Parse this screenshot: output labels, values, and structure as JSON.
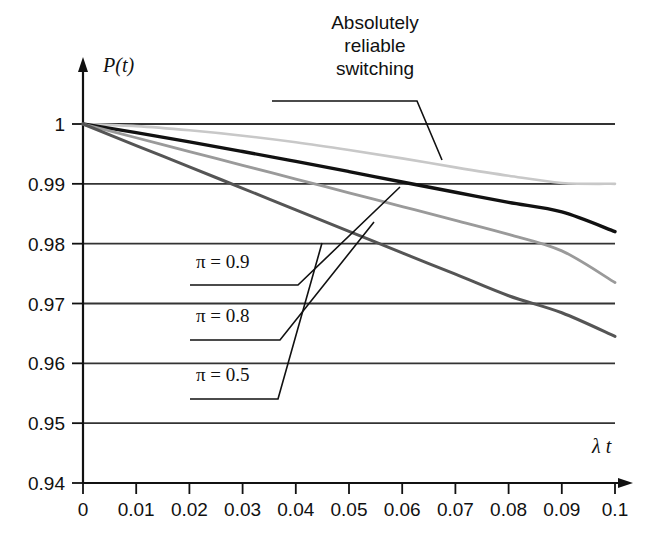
{
  "chart_data": {
    "type": "line",
    "title": "",
    "xlabel": "λ t",
    "ylabel": "P(t)",
    "xlim": [
      0,
      0.1
    ],
    "ylim": [
      0.94,
      1.0
    ],
    "grid": true,
    "legend_position": "inline-callouts",
    "xticks": [
      "0",
      "0.01",
      "0.02",
      "0.03",
      "0.04",
      "0.05",
      "0.06",
      "0.07",
      "0.08",
      "0.09",
      "0.1"
    ],
    "xtick_values": [
      0,
      0.01,
      0.02,
      0.03,
      0.04,
      0.05,
      0.06,
      0.07,
      0.08,
      0.09,
      0.1
    ],
    "yticks": [
      "0.94",
      "0.95",
      "0.96",
      "0.97",
      "0.98",
      "0.99",
      "1"
    ],
    "ytick_values": [
      0.94,
      0.95,
      0.96,
      0.97,
      0.98,
      0.99,
      1.0
    ],
    "x": [
      0,
      0.01,
      0.02,
      0.03,
      0.04,
      0.05,
      0.06,
      0.07,
      0.08,
      0.09,
      0.1
    ],
    "series": [
      {
        "name": "Absolutely reliable switching",
        "color": "#c8c8c8",
        "width": 2.6,
        "values": [
          1.0,
          0.99965,
          0.99895,
          0.99805,
          0.99695,
          0.99565,
          0.99425,
          0.99275,
          0.99135,
          0.99015,
          0.99
        ]
      },
      {
        "name": "π = 0.9",
        "color": "#111111",
        "width": 3.4,
        "values": [
          1.0,
          0.99855,
          0.997,
          0.9954,
          0.99375,
          0.99205,
          0.9903,
          0.9886,
          0.9869,
          0.9853,
          0.982
        ]
      },
      {
        "name": "π = 0.8",
        "color": "#9a9a9a",
        "width": 2.8,
        "values": [
          1.0,
          0.9977,
          0.9954,
          0.9931,
          0.9908,
          0.9885,
          0.9862,
          0.9839,
          0.98155,
          0.9788,
          0.9735
        ]
      },
      {
        "name": "π = 0.5",
        "color": "#555555",
        "width": 3.0,
        "values": [
          1.0,
          0.9964,
          0.99285,
          0.98925,
          0.98565,
          0.98205,
          0.97845,
          0.9749,
          0.9713,
          0.96845,
          0.9645
        ]
      }
    ],
    "annotations": [
      {
        "name": "absolutely-reliable-switching",
        "lines": [
          "Absolutely",
          "reliable",
          "switching"
        ],
        "leader_from": [
          0.098,
          0.9945
        ],
        "label_at": [
          0.045,
          1.0025
        ]
      },
      {
        "name": "pi-0-9",
        "text": "π = 0.9",
        "leader_to": [
          0.0605,
          0.9905
        ],
        "label_at": [
          0.031,
          0.9755
        ]
      },
      {
        "name": "pi-0-8",
        "text": "π = 0.8",
        "leader_to": [
          0.0545,
          0.984
        ],
        "label_at": [
          0.029,
          0.9655
        ]
      },
      {
        "name": "pi-0-5",
        "text": "π = 0.5",
        "leader_to": [
          0.0455,
          0.98
        ],
        "label_at": [
          0.027,
          0.956
        ]
      }
    ]
  },
  "axes": {
    "y_axis_label": "P(t)",
    "x_axis_label": "λ t",
    "y_tick_labels": [
      "1",
      "0.99",
      "0.98",
      "0.97",
      "0.96",
      "0.95",
      "0.94"
    ],
    "x_tick_labels": [
      "0",
      "0.01",
      "0.02",
      "0.03",
      "0.04",
      "0.05",
      "0.06",
      "0.07",
      "0.08",
      "0.09",
      "0.1"
    ]
  },
  "callout": {
    "line1": "Absolutely",
    "line2": "reliable",
    "line3": "switching"
  },
  "series_labels": {
    "pi09": "π = 0.9",
    "pi08": "π = 0.8",
    "pi05": "π = 0.5"
  },
  "colors": {
    "background": "#ffffff",
    "axis": "#111111",
    "grid": "#333333",
    "series_reliable": "#c8c8c8",
    "series_pi09": "#111111",
    "series_pi08": "#9a9a9a",
    "series_pi05": "#555555"
  }
}
